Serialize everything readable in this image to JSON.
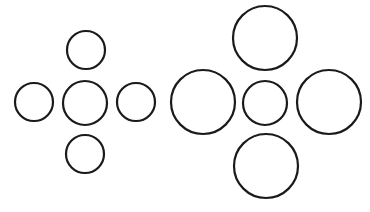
{
  "diagram": {
    "title": "",
    "background": "#ffffff",
    "stroke_color": "#1a1a1a",
    "figures": [
      {
        "name": "left-cluster",
        "center": {
          "cx": 85,
          "cy": 103,
          "r": 22
        },
        "surround": [
          {
            "position": "top",
            "cx": 86,
            "cy": 50,
            "r": 19
          },
          {
            "position": "left",
            "cx": 34,
            "cy": 102,
            "r": 19
          },
          {
            "position": "right",
            "cx": 136,
            "cy": 102,
            "r": 19
          },
          {
            "position": "bottom",
            "cx": 85,
            "cy": 154,
            "r": 19
          }
        ]
      },
      {
        "name": "right-cluster",
        "center": {
          "cx": 265,
          "cy": 103,
          "r": 22
        },
        "surround": [
          {
            "position": "top",
            "cx": 265,
            "cy": 38,
            "r": 32
          },
          {
            "position": "left",
            "cx": 203,
            "cy": 102,
            "r": 32
          },
          {
            "position": "right",
            "cx": 329,
            "cy": 102,
            "r": 32
          },
          {
            "position": "bottom",
            "cx": 266,
            "cy": 166,
            "r": 32
          }
        ]
      }
    ]
  }
}
